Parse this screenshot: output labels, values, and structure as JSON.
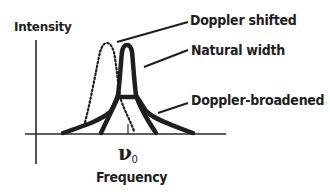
{
  "diagram": {
    "axes": {
      "y_label": "Intensity",
      "x_label": "Frequency",
      "x_marker": {
        "symbol": "ν",
        "subscript": "0"
      }
    },
    "curves": [
      {
        "name": "Natural width",
        "style": "solid-thick"
      },
      {
        "name": "Doppler-broadened",
        "style": "solid-thick"
      },
      {
        "name": "Doppler shifted",
        "style": "dotted"
      }
    ],
    "labels": {
      "doppler_shifted": "Doppler shifted",
      "natural_width": "Natural width",
      "doppler_broadened": "Doppler-broadened"
    },
    "colors": {
      "ink": "#1e1e1e",
      "background": "#ffffff"
    }
  }
}
